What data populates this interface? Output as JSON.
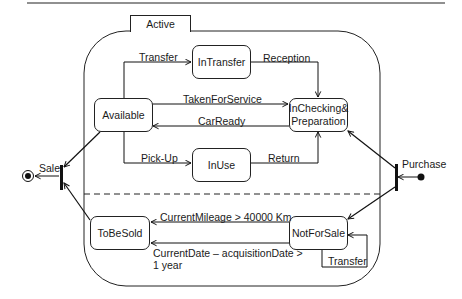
{
  "diagram": {
    "type": "UML state machine",
    "composite_state": {
      "name": "Active"
    },
    "states": [
      {
        "id": "available",
        "label": "Available"
      },
      {
        "id": "intransfer",
        "label": "InTransfer"
      },
      {
        "id": "inchecking",
        "label_line1": "InChecking&",
        "label_line2": "Preparation"
      },
      {
        "id": "inuse",
        "label": "InUse"
      },
      {
        "id": "tobesold",
        "label": "ToBeSold"
      },
      {
        "id": "notforsale",
        "label": "NotForSale"
      }
    ],
    "transitions": {
      "transfer_top": "Transfer",
      "reception": "Reception",
      "taken_for_service": "TakenForService",
      "car_ready": "CarReady",
      "pick_up": "Pick-Up",
      "return": "Return",
      "current_mileage": "CurrentMileage > 40000 Km",
      "current_date_line1": "CurrentDate – acquisitionDate >",
      "current_date_line2": "1 year",
      "transfer_self": "Transfer",
      "sale": "Sale",
      "purchase": "Purchase"
    }
  }
}
